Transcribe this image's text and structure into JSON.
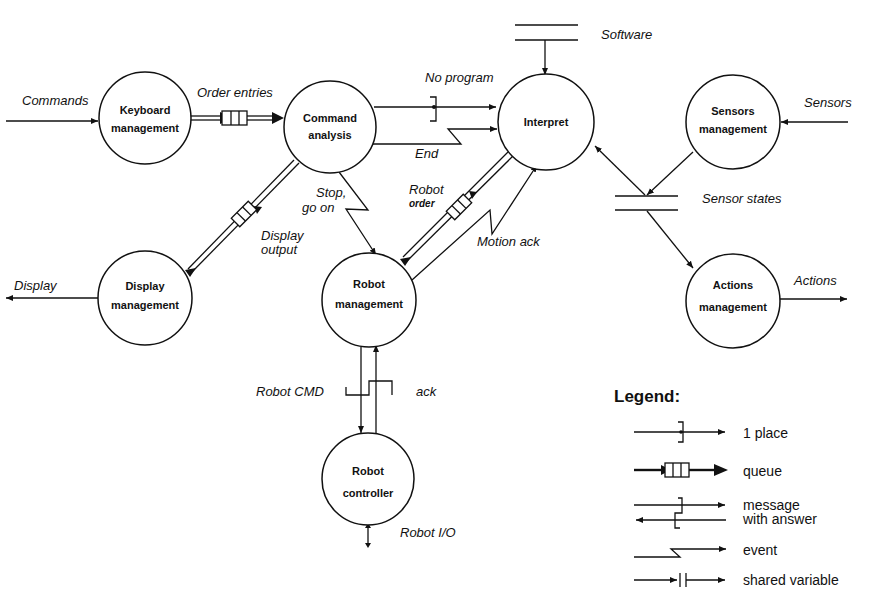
{
  "diagram": {
    "nodes": [
      {
        "id": "keyboard",
        "lines": [
          "Keyboard",
          "management"
        ]
      },
      {
        "id": "command",
        "lines": [
          "Command",
          "analysis"
        ]
      },
      {
        "id": "interpret",
        "lines": [
          "Interpret"
        ]
      },
      {
        "id": "sensors",
        "lines": [
          "Sensors",
          "management"
        ]
      },
      {
        "id": "display",
        "lines": [
          "Display",
          "management"
        ]
      },
      {
        "id": "robot",
        "lines": [
          "Robot",
          "management"
        ]
      },
      {
        "id": "actions",
        "lines": [
          "Actions",
          "management"
        ]
      },
      {
        "id": "controller",
        "lines": [
          "Robot",
          "controller"
        ]
      }
    ],
    "flows": {
      "commands": "Commands",
      "order_entries": "Order entries",
      "no_program": "No  program",
      "end": "End",
      "software": "Software",
      "sensors": "Sensors",
      "sensor_states": "Sensor states",
      "actions": "Actions",
      "display": "Display",
      "display_output_1": "Display",
      "display_output_2": "output",
      "stop_1": "Stop,",
      "stop_2": "go on",
      "robot_order_1": "Robot",
      "robot_order_2": "order",
      "motion_ack": "Motion ack",
      "robot_cmd": "Robot CMD",
      "ack": "ack",
      "robot_io": "Robot I/O"
    },
    "legend": {
      "title": "Legend:",
      "items": [
        {
          "symbol": "1-place",
          "label": "1 place"
        },
        {
          "symbol": "queue",
          "label": "queue"
        },
        {
          "symbol": "message-with-answer",
          "label": "message",
          "label2": "with answer"
        },
        {
          "symbol": "event",
          "label": "event"
        },
        {
          "symbol": "shared-variable",
          "label": "shared variable"
        }
      ]
    }
  }
}
